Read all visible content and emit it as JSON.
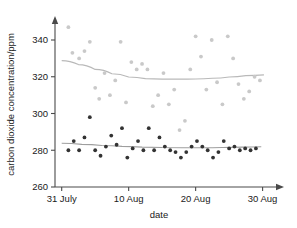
{
  "chart_data": {
    "type": "scatter",
    "title": "",
    "xlabel": "date",
    "ylabel": "carbon dioxide concentration/ppm",
    "xlim": [
      0,
      33
    ],
    "ylim": [
      260,
      350
    ],
    "grid": false,
    "legend": "none",
    "y_ticks": [
      260,
      280,
      300,
      320,
      340
    ],
    "y_tick_labels": [
      "260",
      "280",
      "300",
      "320",
      "340"
    ],
    "x_ticks": [
      1,
      11,
      21,
      31
    ],
    "x_tick_labels": [
      "31 July",
      "10  Aug",
      "20  Aug",
      "30  Aug"
    ],
    "series": [
      {
        "name": "upper-series",
        "color": "#c9c9c9",
        "marker": "circle",
        "x": [
          2,
          2.6,
          3.6,
          4.4,
          5.2,
          6.0,
          6.6,
          7.4,
          8.2,
          9.0,
          9.8,
          10.6,
          11.4,
          12.2,
          13.0,
          13.8,
          14.6,
          15.4,
          16.2,
          17.0,
          17.8,
          18.6,
          19.4,
          20.2,
          21.0,
          21.8,
          22.6,
          23.4,
          24.2,
          25.0,
          25.8,
          26.6,
          27.4,
          28.2,
          29.0,
          29.8,
          30.6
        ],
        "y": [
          347,
          333,
          330,
          334,
          339,
          314,
          308,
          322,
          310,
          318,
          339,
          306,
          328,
          324,
          327,
          324,
          304,
          310,
          322,
          305,
          313,
          291,
          296,
          324,
          342,
          331,
          313,
          340,
          317,
          305,
          342,
          330,
          316,
          308,
          312,
          320,
          318
        ]
      },
      {
        "name": "lower-series",
        "color": "#333333",
        "marker": "circle",
        "x": [
          2,
          2.8,
          3.6,
          4.4,
          5.2,
          6.0,
          6.8,
          7.6,
          8.4,
          9.2,
          10.0,
          10.8,
          11.6,
          12.4,
          13.2,
          14.0,
          14.8,
          15.6,
          16.4,
          17.2,
          18.0,
          18.8,
          19.6,
          20.4,
          21.2,
          22.0,
          22.8,
          23.6,
          24.4,
          25.2,
          26.0,
          26.8,
          27.6,
          28.4,
          29.2,
          30.0
        ],
        "y": [
          280,
          285,
          280,
          287,
          298,
          280,
          277,
          282,
          288,
          283,
          292,
          276,
          281,
          285,
          280,
          292,
          280,
          287,
          282,
          280,
          279,
          276,
          279,
          282,
          285,
          282,
          280,
          276,
          279,
          285,
          281,
          282,
          280,
          281,
          280,
          281
        ]
      }
    ],
    "trend_lines": [
      {
        "name": "upper-trend",
        "color": "#b9b9b9",
        "points_x": [
          1.0,
          3.5,
          6.0,
          8.5,
          11.0,
          13.5,
          16.0,
          18.5,
          21.0,
          23.5,
          26.0,
          28.5,
          31.2
        ],
        "points_y": [
          328.8,
          326.6,
          324.0,
          321.6,
          319.9,
          319.0,
          318.7,
          318.7,
          318.8,
          319.2,
          319.9,
          320.6,
          321.0
        ]
      },
      {
        "name": "lower-trend",
        "color": "#9e9e9e",
        "points_x": [
          1.0,
          4.0,
          7.0,
          10.0,
          13.0,
          16.0,
          19.0,
          22.0,
          25.0,
          28.0,
          30.8
        ],
        "points_y": [
          283.8,
          283.2,
          282.6,
          282.1,
          281.7,
          281.5,
          281.4,
          281.4,
          281.5,
          281.7,
          281.9
        ]
      }
    ]
  }
}
